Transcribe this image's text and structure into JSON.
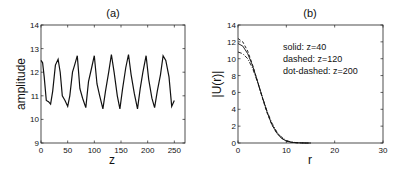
{
  "chart_data": [
    {
      "type": "line",
      "title": "(a)",
      "xlabel": "z",
      "ylabel": "amplitude",
      "xlim": [
        0,
        270
      ],
      "ylim": [
        9,
        14
      ],
      "xticks": [
        0,
        50,
        100,
        150,
        200,
        250
      ],
      "yticks": [
        9,
        10,
        11,
        12,
        13,
        14
      ],
      "grid": false,
      "series": [
        {
          "name": "amplitude",
          "style": "solid",
          "x": [
            0,
            3,
            6,
            10,
            14,
            18,
            22,
            27,
            32,
            36,
            40,
            45,
            50,
            54,
            59,
            63,
            68,
            73,
            78,
            84,
            89,
            95,
            100,
            105,
            110,
            116,
            121,
            127,
            132,
            137,
            143,
            148,
            153,
            159,
            164,
            169,
            175,
            181,
            186,
            191,
            197,
            202,
            208,
            213,
            218,
            224,
            229,
            234,
            240,
            245,
            250
          ],
          "y": [
            12.5,
            12.4,
            11.8,
            10.8,
            10.75,
            10.65,
            11.2,
            12.3,
            12.55,
            12.0,
            11.0,
            10.8,
            10.55,
            11.0,
            12.0,
            12.3,
            12.7,
            11.3,
            10.9,
            10.5,
            11.6,
            12.2,
            12.7,
            11.5,
            11.0,
            10.45,
            11.2,
            12.0,
            12.75,
            12.0,
            11.0,
            10.45,
            11.3,
            12.2,
            12.75,
            11.9,
            11.1,
            10.45,
            11.3,
            12.0,
            12.7,
            11.7,
            10.9,
            10.5,
            11.2,
            11.9,
            12.7,
            12.5,
            11.8,
            10.55,
            10.8
          ]
        }
      ]
    },
    {
      "type": "line",
      "title": "(b)",
      "xlabel": "r",
      "ylabel": "|U(r)|",
      "xlim": [
        0,
        30
      ],
      "ylim": [
        0,
        14
      ],
      "xticks": [
        0,
        10,
        20,
        30
      ],
      "yticks": [
        0,
        2,
        4,
        6,
        8,
        10,
        12,
        14
      ],
      "grid": false,
      "annotations": [
        "solid: z=40",
        "dashed: z=120",
        "dot-dashed: z=200"
      ],
      "series": [
        {
          "name": "solid: z=40",
          "style": "solid",
          "x": [
            0,
            1,
            2,
            3,
            4,
            5,
            6,
            7,
            8,
            9,
            10,
            11,
            12,
            13,
            14,
            15
          ],
          "y": [
            11.8,
            11.5,
            10.6,
            9.2,
            7.4,
            5.5,
            3.7,
            2.2,
            1.2,
            0.55,
            0.22,
            0.08,
            0.03,
            0.01,
            0.0,
            0.0
          ]
        },
        {
          "name": "dashed: z=120",
          "style": "dashed",
          "x": [
            0,
            1,
            2,
            3,
            4,
            5,
            6,
            7,
            8,
            9,
            10,
            11,
            12,
            13,
            14,
            15
          ],
          "y": [
            12.4,
            12.0,
            10.9,
            9.3,
            7.4,
            5.4,
            3.6,
            2.2,
            1.2,
            0.6,
            0.25,
            0.1,
            0.04,
            0.01,
            0.0,
            0.0
          ]
        },
        {
          "name": "dot-dashed: z=200",
          "style": "dot-dashed",
          "x": [
            0,
            1,
            2,
            3,
            4,
            5,
            6,
            7,
            8,
            9,
            10,
            11,
            12,
            13,
            14,
            15
          ],
          "y": [
            10.8,
            10.6,
            10.0,
            8.9,
            7.3,
            5.5,
            3.8,
            2.4,
            1.35,
            0.7,
            0.3,
            0.12,
            0.05,
            0.02,
            0.0,
            0.0
          ]
        }
      ]
    }
  ]
}
